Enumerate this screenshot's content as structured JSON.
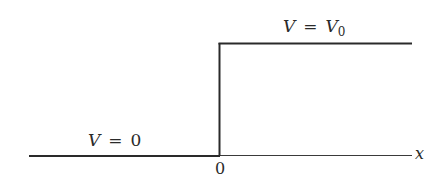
{
  "diagram": {
    "labels": {
      "left_region": {
        "var": "V",
        "eq": "=",
        "value": "0"
      },
      "right_region": {
        "var": "V",
        "eq": "=",
        "value": "V",
        "subscript": "0"
      },
      "origin": "0",
      "axis": "x"
    },
    "colors": {
      "line": "#2a2a2a",
      "background": "#ffffff"
    }
  }
}
